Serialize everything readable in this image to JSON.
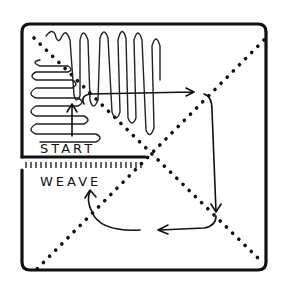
{
  "diagram": {
    "type": "hand-drawn weaving direction diagram",
    "labels": {
      "start": "START",
      "weave": "WEAVE"
    },
    "elements": [
      "square frame",
      "two dotted diagonals",
      "serpentine weft lines in upper-left",
      "arrow path clockwise around center",
      "fringe tick marks at weave line"
    ],
    "colors": {
      "ink": "#111111",
      "background": "#ffffff"
    }
  }
}
